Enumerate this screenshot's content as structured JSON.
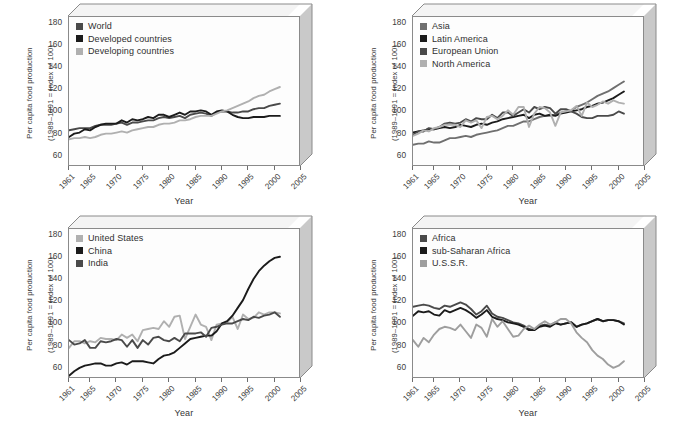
{
  "figure": {
    "axis": {
      "y_title_line1": "Per capita food production",
      "y_title_line2": "(1989–1991 = Index of 100)",
      "x_title": "Year",
      "y_ticks": [
        60,
        80,
        100,
        120,
        140,
        160,
        180
      ],
      "x_ticks": [
        1961,
        1965,
        1970,
        1975,
        1980,
        1985,
        1990,
        1995,
        2000,
        2005
      ],
      "ylim": [
        50,
        185
      ],
      "xlim": [
        1961,
        2005
      ]
    },
    "colors": {
      "black": "#1b1b1b",
      "dark_gray": "#4a4a4a",
      "medium_gray": "#6f6f6f",
      "light_gray": "#b0b0b0",
      "frame": "#8a8a8a",
      "side_face": "#c9c9c9",
      "top_face": "#f4f4f4",
      "plot_bg": "#fdfdfd"
    }
  },
  "chart_data": [
    {
      "id": "panel-world",
      "type": "line",
      "title": "",
      "xlabel": "Year",
      "ylabel": "Per capita food production (1989–1991 = Index of 100)",
      "xlim": [
        1961,
        2005
      ],
      "ylim": [
        50,
        185
      ],
      "grid": false,
      "legend_position": "top-left-inside",
      "x": [
        1961,
        1962,
        1963,
        1964,
        1965,
        1966,
        1967,
        1968,
        1969,
        1970,
        1971,
        1972,
        1973,
        1974,
        1975,
        1976,
        1977,
        1978,
        1979,
        1980,
        1981,
        1982,
        1983,
        1984,
        1985,
        1986,
        1987,
        1988,
        1989,
        1990,
        1991,
        1992,
        1993,
        1994,
        1995,
        1996,
        1997,
        1998,
        1999,
        2000,
        2001
      ],
      "series": [
        {
          "name": "World",
          "color": "#4a4a4a",
          "values": [
            83,
            84,
            85,
            85,
            85,
            87,
            88,
            88,
            88,
            89,
            90,
            88,
            90,
            90,
            91,
            92,
            92,
            94,
            95,
            94,
            95,
            96,
            94,
            97,
            98,
            99,
            98,
            96,
            99,
            100,
            100,
            99,
            99,
            100,
            100,
            102,
            103,
            103,
            105,
            106,
            107
          ]
        },
        {
          "name": "Developed countries",
          "color": "#1b1b1b",
          "values": [
            77,
            80,
            81,
            84,
            83,
            86,
            88,
            89,
            89,
            89,
            92,
            90,
            93,
            92,
            93,
            95,
            94,
            97,
            97,
            95,
            97,
            99,
            97,
            100,
            100,
            101,
            100,
            97,
            100,
            101,
            100,
            97,
            95,
            94,
            94,
            95,
            95,
            95,
            96,
            96,
            96
          ]
        },
        {
          "name": "Developing countries",
          "color": "#b0b0b0",
          "values": [
            75,
            76,
            76,
            77,
            76,
            77,
            79,
            80,
            80,
            81,
            82,
            81,
            83,
            84,
            85,
            86,
            86,
            88,
            89,
            89,
            90,
            92,
            92,
            93,
            95,
            96,
            96,
            96,
            98,
            100,
            101,
            103,
            105,
            107,
            109,
            112,
            114,
            115,
            118,
            120,
            122
          ]
        }
      ]
    },
    {
      "id": "panel-regions",
      "type": "line",
      "title": "",
      "xlabel": "Year",
      "ylabel": "Per capita food production (1989–1991 = Index of 100)",
      "xlim": [
        1961,
        2005
      ],
      "ylim": [
        50,
        185
      ],
      "grid": false,
      "legend_position": "top-left-inside",
      "x": [
        1961,
        1962,
        1963,
        1964,
        1965,
        1966,
        1967,
        1968,
        1969,
        1970,
        1971,
        1972,
        1973,
        1974,
        1975,
        1976,
        1977,
        1978,
        1979,
        1980,
        1981,
        1982,
        1983,
        1984,
        1985,
        1986,
        1987,
        1988,
        1989,
        1990,
        1991,
        1992,
        1993,
        1994,
        1995,
        1996,
        1997,
        1998,
        1999,
        2000,
        2001
      ],
      "series": [
        {
          "name": "Asia",
          "color": "#6f6f6f",
          "values": [
            70,
            71,
            71,
            73,
            72,
            72,
            74,
            76,
            76,
            77,
            78,
            77,
            79,
            80,
            81,
            82,
            83,
            85,
            87,
            87,
            89,
            91,
            91,
            93,
            95,
            96,
            96,
            97,
            99,
            100,
            101,
            104,
            106,
            108,
            111,
            114,
            116,
            118,
            121,
            124,
            127
          ]
        },
        {
          "name": "Latin America",
          "color": "#1b1b1b",
          "values": [
            81,
            82,
            83,
            84,
            84,
            85,
            86,
            85,
            86,
            88,
            87,
            86,
            88,
            89,
            88,
            90,
            91,
            93,
            94,
            95,
            96,
            97,
            94,
            97,
            98,
            96,
            97,
            96,
            98,
            99,
            100,
            101,
            102,
            104,
            105,
            107,
            108,
            110,
            112,
            115,
            118
          ]
        },
        {
          "name": "European Union",
          "color": "#4a4a4a",
          "values": [
            79,
            82,
            82,
            85,
            84,
            86,
            89,
            90,
            89,
            90,
            93,
            91,
            94,
            93,
            93,
            97,
            94,
            99,
            99,
            96,
            99,
            102,
            99,
            104,
            102,
            104,
            103,
            98,
            102,
            102,
            100,
            98,
            95,
            94,
            94,
            96,
            96,
            96,
            97,
            100,
            98
          ]
        },
        {
          "name": "North America",
          "color": "#b0b0b0",
          "values": [
            78,
            80,
            83,
            82,
            85,
            86,
            88,
            88,
            88,
            86,
            92,
            90,
            92,
            85,
            95,
            96,
            93,
            96,
            101,
            97,
            104,
            104,
            86,
            98,
            104,
            103,
            99,
            87,
            99,
            100,
            101,
            105,
            96,
            108,
            104,
            106,
            109,
            107,
            110,
            108,
            107
          ]
        }
      ]
    },
    {
      "id": "panel-countries",
      "type": "line",
      "title": "",
      "xlabel": "Year",
      "ylabel": "Per capita food production (1989–1991 = Index of 100)",
      "xlim": [
        1961,
        2005
      ],
      "ylim": [
        50,
        185
      ],
      "grid": false,
      "legend_position": "top-left-inside",
      "x": [
        1961,
        1962,
        1963,
        1964,
        1965,
        1966,
        1967,
        1968,
        1969,
        1970,
        1971,
        1972,
        1973,
        1974,
        1975,
        1976,
        1977,
        1978,
        1979,
        1980,
        1981,
        1982,
        1983,
        1984,
        1985,
        1986,
        1987,
        1988,
        1989,
        1990,
        1991,
        1992,
        1993,
        1994,
        1995,
        1996,
        1997,
        1998,
        1999,
        2000,
        2001
      ],
      "series": [
        {
          "name": "United States",
          "color": "#b0b0b0",
          "values": [
            78,
            84,
            84,
            82,
            84,
            83,
            87,
            86,
            86,
            85,
            90,
            87,
            90,
            84,
            94,
            95,
            96,
            95,
            102,
            97,
            106,
            107,
            86,
            97,
            108,
            99,
            97,
            85,
            99,
            100,
            101,
            106,
            95,
            108,
            104,
            105,
            110,
            108,
            110,
            110,
            109
          ]
        },
        {
          "name": "China",
          "color": "#1b1b1b",
          "values": [
            53,
            57,
            60,
            62,
            63,
            64,
            64,
            62,
            62,
            64,
            65,
            63,
            66,
            66,
            66,
            65,
            64,
            68,
            71,
            72,
            74,
            78,
            82,
            86,
            87,
            88,
            89,
            89,
            93,
            100,
            102,
            107,
            114,
            121,
            131,
            140,
            147,
            152,
            156,
            159,
            160
          ]
        },
        {
          "name": "India",
          "color": "#4a4a4a",
          "values": [
            85,
            81,
            82,
            85,
            78,
            78,
            84,
            83,
            84,
            86,
            85,
            79,
            85,
            78,
            85,
            81,
            87,
            88,
            85,
            84,
            87,
            84,
            91,
            91,
            91,
            92,
            88,
            96,
            97,
            99,
            100,
            100,
            102,
            104,
            103,
            106,
            105,
            107,
            108,
            110,
            106
          ]
        }
      ]
    },
    {
      "id": "panel-africa-ussr",
      "type": "line",
      "title": "",
      "xlabel": "Year",
      "ylabel": "Per capita food production (1989–1991 = Index of 100)",
      "xlim": [
        1961,
        2005
      ],
      "ylim": [
        50,
        185
      ],
      "grid": false,
      "legend_position": "top-left-inside",
      "x": [
        1961,
        1962,
        1963,
        1964,
        1965,
        1966,
        1967,
        1968,
        1969,
        1970,
        1971,
        1972,
        1973,
        1974,
        1975,
        1976,
        1977,
        1978,
        1979,
        1980,
        1981,
        1982,
        1983,
        1984,
        1985,
        1986,
        1987,
        1988,
        1989,
        1990,
        1991,
        1992,
        1993,
        1994,
        1995,
        1996,
        1997,
        1998,
        1999,
        2000,
        2001
      ],
      "series": [
        {
          "name": "Africa",
          "color": "#4a4a4a",
          "values": [
            115,
            116,
            117,
            116,
            114,
            113,
            116,
            115,
            117,
            119,
            117,
            113,
            108,
            111,
            116,
            109,
            106,
            105,
            103,
            101,
            100,
            98,
            95,
            94,
            98,
            99,
            98,
            101,
            99,
            100,
            101,
            97,
            99,
            100,
            102,
            104,
            102,
            103,
            103,
            102,
            100
          ]
        },
        {
          "name": "sub-Saharan Africa",
          "color": "#1b1b1b",
          "values": [
            107,
            111,
            110,
            111,
            108,
            107,
            112,
            110,
            112,
            114,
            112,
            109,
            105,
            108,
            112,
            106,
            104,
            103,
            101,
            100,
            99,
            97,
            94,
            94,
            97,
            98,
            97,
            100,
            99,
            100,
            101,
            97,
            99,
            100,
            102,
            104,
            102,
            103,
            103,
            102,
            99
          ]
        },
        {
          "name": "U.S.S.R.",
          "color": "#9e9e9e",
          "values": [
            85,
            79,
            87,
            83,
            90,
            95,
            97,
            96,
            94,
            99,
            93,
            87,
            99,
            96,
            88,
            104,
            97,
            102,
            95,
            88,
            89,
            95,
            98,
            95,
            99,
            102,
            99,
            101,
            104,
            104,
            100,
            92,
            87,
            83,
            76,
            71,
            68,
            63,
            60,
            62,
            66
          ]
        }
      ]
    }
  ]
}
